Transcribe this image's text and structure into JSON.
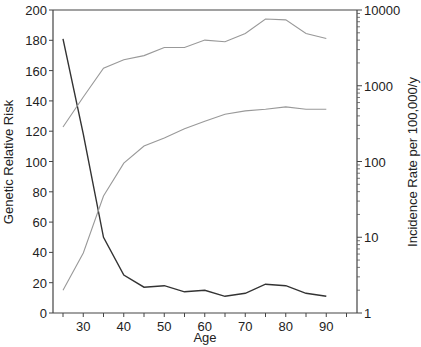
{
  "chart_data": {
    "type": "line",
    "title": "",
    "xlabel": "Age",
    "ylabel": "Genetic Relative Risk",
    "y2label": "Incidence Rate per 100,000/y",
    "x": [
      25,
      30,
      35,
      40,
      45,
      50,
      55,
      60,
      65,
      70,
      75,
      80,
      85,
      90
    ],
    "xlim": [
      22,
      97
    ],
    "ylim": [
      0,
      200
    ],
    "y2lim": [
      1,
      10000
    ],
    "y2scale": "log",
    "x_ticks": [
      30,
      40,
      50,
      60,
      70,
      80,
      90
    ],
    "x_minor_ticks": [
      25,
      35,
      45,
      55,
      65,
      75,
      85,
      95
    ],
    "y_ticks": [
      0,
      20,
      40,
      60,
      80,
      100,
      120,
      140,
      160,
      180,
      200
    ],
    "y2_ticks": [
      1,
      10,
      100,
      1000,
      10000
    ],
    "grid": false,
    "legend": null,
    "series": [
      {
        "name": "Genetic Relative Risk",
        "axis": "left",
        "color": "#333333",
        "values": [
          181,
          118,
          50,
          25,
          17,
          18,
          14,
          15,
          11,
          13,
          19,
          18,
          13,
          11
        ]
      },
      {
        "name": "Incidence Rate (upper curve)",
        "axis": "right",
        "color": "#999999",
        "values": [
          285,
          710,
          1700,
          2200,
          2500,
          3200,
          3200,
          4000,
          3800,
          4900,
          7600,
          7400,
          4900,
          4200
        ]
      },
      {
        "name": "Incidence Rate (lower curve)",
        "axis": "right",
        "color": "#999999",
        "values": [
          2,
          6.2,
          35,
          95,
          160,
          205,
          270,
          340,
          420,
          465,
          490,
          525,
          490,
          490
        ]
      }
    ]
  },
  "labels": {
    "x_title": "Age",
    "y_title": "Genetic Relative Risk",
    "y2_title": "Incidence Rate per 100,000/y"
  }
}
